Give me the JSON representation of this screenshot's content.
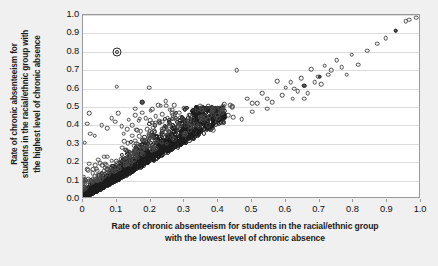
{
  "chart_data": {
    "type": "scatter",
    "title": "",
    "xlabel": "Rate of chronic absenteeism for students in the racial/ethnic group with the lowest level of chronic absence",
    "xlabel_line1": "Rate of chronic absenteeism for students in the racial/ethnic group",
    "xlabel_line2": "with the lowest level of chronic absence",
    "ylabel": "Rate of chronic absenteeism for students in the racial/ethnic group with the highest level of chronic absence",
    "ylabel_line1": "Rate of chronic absenteeism for",
    "ylabel_line2": "students in the racial/ethnic group with",
    "ylabel_line3": "the highest level of chronic absence",
    "xlim": [
      0,
      1.0
    ],
    "ylim": [
      0,
      1.0
    ],
    "xticks": [
      "0",
      "0.1",
      "0.2",
      "0.3",
      "0.4",
      "0.5",
      "0.6",
      "0.7",
      "0.8",
      "0.9",
      "1.0"
    ],
    "xtick_values": [
      0,
      0.1,
      0.2,
      0.3,
      0.4,
      0.5,
      0.6,
      0.7,
      0.8,
      0.9,
      1.0
    ],
    "yticks": [
      "0.0",
      "0.1",
      "0.2",
      "0.3",
      "0.4",
      "0.5",
      "0.6",
      "0.7",
      "0.8",
      "0.9",
      "1.0"
    ],
    "ytick_values": [
      0.0,
      0.1,
      0.2,
      0.3,
      0.4,
      0.5,
      0.6,
      0.7,
      0.8,
      0.9,
      1.0
    ],
    "grid": "horizontal",
    "legend": null,
    "marker": "open-circle",
    "marker_color": "#3a3a3a",
    "plot_background": "#ffffff",
    "figure_background": "#f0f0f0",
    "gridline_color": "#dcdcdc",
    "highlighted_point": {
      "x": 0.1,
      "y": 0.8,
      "style": "double-ring"
    },
    "points_sparse": [
      [
        0.005,
        0.305
      ],
      [
        0.013,
        0.41
      ],
      [
        0.018,
        0.465
      ],
      [
        0.1,
        0.61
      ],
      [
        0.022,
        0.355
      ],
      [
        0.035,
        0.345
      ],
      [
        0.055,
        0.4
      ],
      [
        0.072,
        0.385
      ],
      [
        0.085,
        0.44
      ],
      [
        0.095,
        0.42
      ],
      [
        0.105,
        0.465
      ],
      [
        0.115,
        0.395
      ],
      [
        0.12,
        0.355
      ],
      [
        0.135,
        0.43
      ],
      [
        0.145,
        0.4
      ],
      [
        0.155,
        0.455
      ],
      [
        0.165,
        0.425
      ],
      [
        0.175,
        0.47
      ],
      [
        0.185,
        0.44
      ],
      [
        0.195,
        0.605
      ],
      [
        0.2,
        0.48
      ],
      [
        0.205,
        0.415
      ],
      [
        0.215,
        0.45
      ],
      [
        0.225,
        0.425
      ],
      [
        0.235,
        0.46
      ],
      [
        0.245,
        0.53
      ],
      [
        0.25,
        0.44
      ],
      [
        0.255,
        0.41
      ],
      [
        0.265,
        0.455
      ],
      [
        0.275,
        0.43
      ],
      [
        0.285,
        0.47
      ],
      [
        0.295,
        0.44
      ],
      [
        0.305,
        0.42
      ],
      [
        0.315,
        0.455
      ],
      [
        0.325,
        0.435
      ],
      [
        0.335,
        0.405
      ],
      [
        0.345,
        0.445
      ],
      [
        0.355,
        0.425
      ],
      [
        0.175,
        0.525
      ],
      [
        0.155,
        0.49
      ],
      [
        0.37,
        0.4
      ],
      [
        0.385,
        0.375
      ],
      [
        0.4,
        0.44
      ],
      [
        0.415,
        0.415
      ],
      [
        0.43,
        0.455
      ],
      [
        0.455,
        0.7
      ],
      [
        0.47,
        0.435
      ],
      [
        0.485,
        0.545
      ],
      [
        0.5,
        0.475
      ],
      [
        0.515,
        0.52
      ],
      [
        0.545,
        0.545
      ],
      [
        0.56,
        0.525
      ],
      [
        0.575,
        0.64
      ],
      [
        0.59,
        0.565
      ],
      [
        0.6,
        0.605
      ],
      [
        0.615,
        0.635
      ],
      [
        0.625,
        0.6
      ],
      [
        0.635,
        0.585
      ],
      [
        0.645,
        0.655
      ],
      [
        0.655,
        0.615
      ],
      [
        0.665,
        0.575
      ],
      [
        0.675,
        0.705
      ],
      [
        0.685,
        0.635
      ],
      [
        0.695,
        0.665
      ],
      [
        0.705,
        0.625
      ],
      [
        0.715,
        0.725
      ],
      [
        0.725,
        0.675
      ],
      [
        0.735,
        0.7
      ],
      [
        0.75,
        0.755
      ],
      [
        0.765,
        0.715
      ],
      [
        0.78,
        0.675
      ],
      [
        0.795,
        0.785
      ],
      [
        0.815,
        0.73
      ],
      [
        0.84,
        0.805
      ],
      [
        0.87,
        0.845
      ],
      [
        0.895,
        0.875
      ],
      [
        0.925,
        0.915
      ],
      [
        0.955,
        0.965
      ],
      [
        0.965,
        0.975
      ],
      [
        0.985,
        0.985
      ],
      [
        0.5,
        0.52
      ],
      [
        0.53,
        0.575
      ],
      [
        0.545,
        0.49
      ],
      [
        0.62,
        0.545
      ],
      [
        0.655,
        0.545
      ],
      [
        0.445,
        0.445
      ],
      [
        0.41,
        0.485
      ],
      [
        0.36,
        0.485
      ],
      [
        0.3,
        0.495
      ],
      [
        0.27,
        0.51
      ],
      [
        0.24,
        0.385
      ],
      [
        0.21,
        0.37
      ],
      [
        0.19,
        0.38
      ],
      [
        0.16,
        0.375
      ],
      [
        0.13,
        0.38
      ]
    ],
    "dense_cluster_note": "Large dense band of open circles along the diagonal from (0,0) to about (0.40,0.45), widening upward; roughly 1800 overlapping markers."
  }
}
